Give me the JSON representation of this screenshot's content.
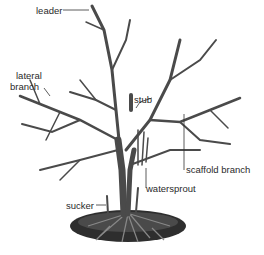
{
  "diagram": {
    "labels": {
      "leader": "leader",
      "lateral_branch_line1": "lateral",
      "lateral_branch_line2": "branch",
      "stub": "stub",
      "scaffold_branch": "scaffold branch",
      "watersprout": "watersprout",
      "sucker": "sucker"
    },
    "colors": {
      "branch": "#4a4a4a",
      "branch_light": "#8a8a8a",
      "soil": "#2a2a2a",
      "leader_line": "#333333",
      "text": "#2a2a2a"
    }
  }
}
